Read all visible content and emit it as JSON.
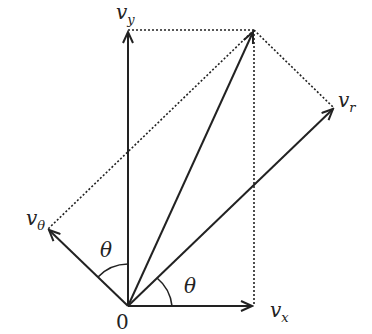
{
  "diagram": {
    "origin_label": "0",
    "labels": {
      "vy": {
        "base": "v",
        "sub": "y"
      },
      "vx": {
        "base": "v",
        "sub": "x"
      },
      "vr": {
        "base": "v",
        "sub": "r"
      },
      "vtheta": {
        "base": "v",
        "sub": "θ"
      },
      "theta_upper": "θ",
      "theta_lower": "θ"
    },
    "colors": {
      "line": "#222222",
      "background": "#ffffff"
    }
  }
}
